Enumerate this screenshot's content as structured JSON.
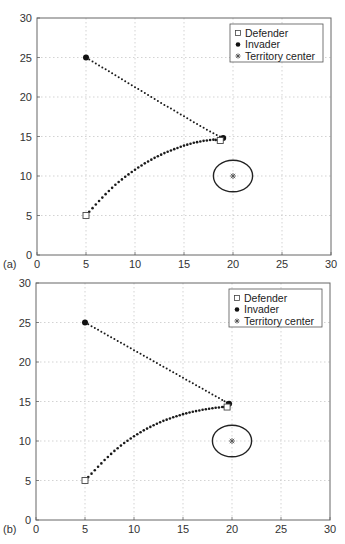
{
  "chart_data": [
    {
      "type": "scatter",
      "panel_label": "(a)",
      "title": "",
      "xlabel": "",
      "ylabel": "",
      "xlim": [
        0,
        30
      ],
      "ylim": [
        0,
        30
      ],
      "xticks": [
        0,
        5,
        10,
        15,
        20,
        25,
        30
      ],
      "yticks": [
        0,
        5,
        10,
        15,
        20,
        25,
        30
      ],
      "grid": true,
      "legend_position": "upper right",
      "legend": [
        "Defender",
        "Invader",
        "Territory center"
      ],
      "series": [
        {
          "name": "Invader",
          "marker": "filled-circle",
          "start": [
            5,
            25
          ],
          "end": [
            19.0,
            14.8
          ],
          "path": [
            [
              5,
              25
            ],
            [
              6,
              24.25
            ],
            [
              7,
              23.5
            ],
            [
              8,
              22.75
            ],
            [
              9,
              22
            ],
            [
              10,
              21.25
            ],
            [
              11,
              20.5
            ],
            [
              12,
              19.75
            ],
            [
              13,
              19.0
            ],
            [
              14,
              18.3
            ],
            [
              15,
              17.55
            ],
            [
              16,
              16.8
            ],
            [
              17,
              16.1
            ],
            [
              18,
              15.4
            ],
            [
              19.0,
              14.8
            ]
          ]
        },
        {
          "name": "Defender",
          "marker": "open-square",
          "start": [
            5,
            5
          ],
          "end": [
            18.7,
            14.5
          ],
          "path": [
            [
              5,
              5
            ],
            [
              6,
              6.4
            ],
            [
              7,
              7.7
            ],
            [
              8,
              8.9
            ],
            [
              9,
              9.9
            ],
            [
              10,
              10.8
            ],
            [
              11,
              11.6
            ],
            [
              12,
              12.3
            ],
            [
              13,
              12.9
            ],
            [
              14,
              13.4
            ],
            [
              15,
              13.85
            ],
            [
              16,
              14.2
            ],
            [
              17,
              14.45
            ],
            [
              18,
              14.6
            ],
            [
              18.7,
              14.5
            ]
          ]
        },
        {
          "name": "Territory center",
          "marker": "asterisk",
          "point": [
            20,
            10
          ],
          "boundary": {
            "shape": "ellipse",
            "cx": 20,
            "cy": 10,
            "rx": 2,
            "ry": 2
          }
        }
      ]
    },
    {
      "type": "scatter",
      "panel_label": "(b)",
      "title": "",
      "xlabel": "",
      "ylabel": "",
      "xlim": [
        0,
        30
      ],
      "ylim": [
        0,
        30
      ],
      "xticks": [
        0,
        5,
        10,
        15,
        20,
        25,
        30
      ],
      "yticks": [
        0,
        5,
        10,
        15,
        20,
        25,
        30
      ],
      "grid": true,
      "legend_position": "upper right",
      "legend": [
        "Defender",
        "Invader",
        "Territory center"
      ],
      "series": [
        {
          "name": "Invader",
          "marker": "filled-circle",
          "start": [
            5,
            25
          ],
          "end": [
            19.7,
            14.7
          ],
          "path": [
            [
              5,
              25
            ],
            [
              6,
              24.3
            ],
            [
              7,
              23.6
            ],
            [
              8,
              22.9
            ],
            [
              9,
              22.2
            ],
            [
              10,
              21.5
            ],
            [
              11,
              20.8
            ],
            [
              12,
              20.1
            ],
            [
              13,
              19.4
            ],
            [
              14,
              18.7
            ],
            [
              15,
              18.0
            ],
            [
              16,
              17.3
            ],
            [
              17,
              16.6
            ],
            [
              18,
              15.9
            ],
            [
              19,
              15.2
            ],
            [
              19.7,
              14.7
            ]
          ]
        },
        {
          "name": "Defender",
          "marker": "open-square",
          "start": [
            5,
            5
          ],
          "end": [
            19.5,
            14.3
          ],
          "path": [
            [
              5,
              5
            ],
            [
              6,
              6.3
            ],
            [
              7,
              7.6
            ],
            [
              8,
              8.75
            ],
            [
              9,
              9.75
            ],
            [
              10,
              10.6
            ],
            [
              11,
              11.35
            ],
            [
              12,
              12.0
            ],
            [
              13,
              12.55
            ],
            [
              14,
              13.0
            ],
            [
              15,
              13.4
            ],
            [
              16,
              13.7
            ],
            [
              17,
              13.95
            ],
            [
              18,
              14.15
            ],
            [
              19,
              14.3
            ],
            [
              19.5,
              14.3
            ]
          ]
        },
        {
          "name": "Territory center",
          "marker": "asterisk",
          "point": [
            20,
            10
          ],
          "boundary": {
            "shape": "ellipse",
            "cx": 20,
            "cy": 10,
            "rx": 2,
            "ry": 2
          }
        }
      ]
    }
  ],
  "layout": {
    "panels": [
      {
        "left": 37,
        "right": 331,
        "top": 18,
        "bottom": 255
      },
      {
        "left": 36,
        "right": 330,
        "top": 11,
        "bottom": 248
      }
    ],
    "colors": {
      "axis": "#666666",
      "grid": "#c8c8c8",
      "marker": "#1a1a1a",
      "ellipse": "#222222",
      "center": "#555555"
    }
  }
}
